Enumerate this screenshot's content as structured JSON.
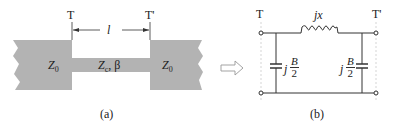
{
  "figure_a": {
    "caption": "(a)",
    "terminal_left": "T",
    "terminal_right": "T'",
    "length_label": "l",
    "left_section": {
      "label_main": "Z",
      "label_sub": "0"
    },
    "middle_section": {
      "label_main": "Z",
      "label_sub": "c",
      "label_extra": ", β"
    },
    "right_section": {
      "label_main": "Z",
      "label_sub": "0"
    },
    "fill_color": "#b3b3b3"
  },
  "arrow": {
    "symbol": "⇒",
    "meaning": "equivalent-to"
  },
  "figure_b": {
    "caption": "(b)",
    "terminal_left": "T",
    "terminal_right": "T'",
    "series_element": {
      "type": "inductor",
      "label": "jx"
    },
    "shunt_left": {
      "type": "capacitor",
      "prefix": "j",
      "numerator": "B",
      "denominator": "2"
    },
    "shunt_right": {
      "type": "capacitor",
      "prefix": "j",
      "numerator": "B",
      "denominator": "2"
    }
  }
}
